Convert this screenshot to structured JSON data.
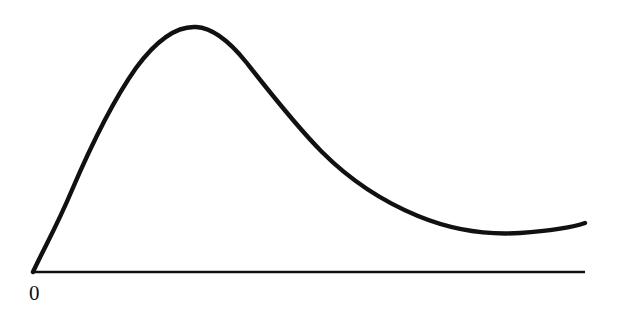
{
  "figure": {
    "background_color": "#ffffff",
    "ink_color": "#111111",
    "width": 619,
    "height": 326,
    "origin_label": "0",
    "axis": {
      "name": "horizontal-axis",
      "x_start": 33,
      "x_end": 585,
      "y": 272,
      "stroke_width": 2.6
    },
    "curve": {
      "name": "plotted-curve",
      "stroke_width": 4.4,
      "path": "M 33 272 C 44 248, 56 228, 72 190 C 90 148, 112 102, 136 68 C 158 38, 178 26, 196 27 C 214 28, 230 42, 246 62 C 268 90, 296 126, 322 152 C 350 180, 384 202, 418 216 C 452 230, 488 235, 520 233 C 548 231, 570 228, 585 223"
    }
  },
  "chart_data": {
    "type": "line",
    "title": "",
    "xlabel": "",
    "ylabel": "",
    "grid": false,
    "legend": null,
    "axis_ticks": [
      "0"
    ],
    "xlim": [
      0,
      100
    ],
    "ylim": [
      0,
      100
    ],
    "series": [
      {
        "name": "curve",
        "x": [
          0,
          5,
          8,
          12,
          19,
          24,
          29,
          35,
          39,
          44,
          49,
          58,
          65,
          70,
          76,
          84,
          89,
          95,
          100
        ],
        "y": [
          0,
          20,
          31,
          46,
          66,
          80,
          89,
          89,
          85,
          79,
          72,
          58,
          47,
          37,
          28,
          19,
          15,
          14,
          18
        ]
      }
    ],
    "annotations": [
      {
        "text": "0",
        "x": 0,
        "y": 0,
        "position": "below-origin"
      }
    ]
  }
}
